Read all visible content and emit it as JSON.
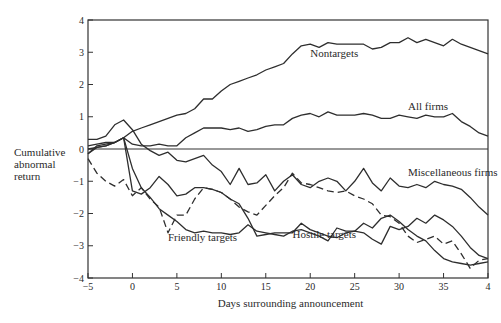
{
  "chart_data": {
    "type": "line",
    "title": "",
    "xlabel": "Days surrounding announcement",
    "ylabel": "Cumulative abnormal return",
    "ylabel_lines": [
      "Cumulative",
      "abnormal",
      "return"
    ],
    "xlim": [
      -5,
      40
    ],
    "ylim": [
      -4,
      4
    ],
    "x_ticks": [
      -5,
      0,
      5,
      10,
      15,
      20,
      25,
      30,
      35,
      40
    ],
    "x_tick_labels": [
      "−5",
      "0",
      "5",
      "10",
      "15",
      "20",
      "25",
      "30",
      "35",
      "4"
    ],
    "y_ticks": [
      -4,
      -3,
      -2,
      -1,
      0,
      1,
      2,
      3,
      4
    ],
    "y_tick_labels": [
      "−4",
      "−3",
      "−2",
      "−1",
      "0",
      "1",
      "2",
      "3",
      "4"
    ],
    "grid": false,
    "zero_line": true,
    "legend": "inline annotations",
    "x": [
      -5,
      -4,
      -3,
      -2,
      -1,
      0,
      1,
      2,
      3,
      4,
      5,
      6,
      7,
      8,
      9,
      10,
      11,
      12,
      13,
      14,
      15,
      16,
      17,
      18,
      19,
      20,
      21,
      22,
      23,
      24,
      25,
      26,
      27,
      28,
      29,
      30,
      31,
      32,
      33,
      34,
      35,
      36,
      37,
      38,
      39,
      40
    ],
    "series": [
      {
        "name": "Nontargets",
        "style": "solid",
        "values": [
          0.0,
          0.05,
          0.1,
          0.2,
          0.35,
          0.55,
          0.65,
          0.75,
          0.85,
          0.95,
          1.05,
          1.1,
          1.25,
          1.55,
          1.55,
          1.8,
          2.0,
          2.1,
          2.2,
          2.3,
          2.45,
          2.55,
          2.65,
          2.95,
          3.2,
          3.25,
          3.15,
          3.3,
          3.25,
          3.25,
          3.25,
          3.25,
          3.1,
          3.15,
          3.3,
          3.3,
          3.45,
          3.3,
          3.4,
          3.3,
          3.2,
          3.4,
          3.25,
          3.15,
          3.05,
          2.95
        ]
      },
      {
        "name": "All firms",
        "style": "solid",
        "values": [
          0.1,
          0.15,
          0.2,
          0.2,
          0.35,
          0.15,
          0.1,
          0.1,
          0.15,
          0.1,
          0.1,
          0.35,
          0.5,
          0.65,
          0.65,
          0.65,
          0.6,
          0.65,
          0.55,
          0.6,
          0.7,
          0.75,
          0.75,
          0.95,
          1.05,
          1.1,
          1.0,
          1.15,
          1.05,
          1.05,
          1.05,
          1.1,
          1.05,
          0.95,
          0.95,
          1.05,
          1.0,
          0.95,
          1.05,
          1.0,
          1.0,
          1.1,
          0.85,
          0.7,
          0.5,
          0.4
        ]
      },
      {
        "name": "Cumulative (upper hump)",
        "style": "solid",
        "values": [
          0.3,
          0.3,
          0.4,
          0.75,
          0.9,
          0.6,
          0.15,
          -0.05,
          -0.2,
          -0.1,
          -0.35,
          -0.4,
          -0.3,
          -0.2,
          -0.5,
          -0.7,
          -1.1,
          -0.6,
          -1.1,
          -1.05,
          -0.8,
          -1.3,
          -1.0,
          -0.8,
          -1.1,
          -1.2,
          -1.0,
          -0.9,
          -1.0,
          -1.3,
          -1.0,
          -0.6,
          -1.05,
          -1.3,
          -0.9,
          -1.15,
          -1.2,
          -1.1,
          -1.2,
          -1.0,
          -1.1,
          -1.15,
          -1.25,
          -1.5,
          -1.8,
          -2.05
        ]
      },
      {
        "name": "Miscellaneous firms",
        "style": "solid",
        "values": [
          -0.15,
          0.1,
          0.15,
          0.2,
          0.35,
          -1.3,
          -1.4,
          -1.2,
          -0.85,
          -1.1,
          -1.45,
          -1.4,
          -1.2,
          -1.2,
          -1.25,
          -1.35,
          -1.55,
          -1.7,
          -2.15,
          -2.7,
          -2.65,
          -2.6,
          -2.6,
          -2.6,
          -2.3,
          -2.5,
          -2.6,
          -2.7,
          -2.75,
          -2.6,
          -2.55,
          -2.6,
          -2.8,
          -2.95,
          -2.4,
          -2.5,
          -2.4,
          -2.15,
          -2.3,
          -2.05,
          -2.2,
          -2.4,
          -2.7,
          -3.05,
          -3.3,
          -3.4
        ]
      },
      {
        "name": "Friendly targets",
        "style": "dashed",
        "values": [
          -0.3,
          -0.75,
          -1.0,
          -1.15,
          -0.95,
          -1.45,
          -1.2,
          -1.55,
          -1.8,
          -2.6,
          -2.05,
          -2.05,
          -1.55,
          -1.2,
          -1.25,
          -1.35,
          -1.55,
          -1.8,
          -1.95,
          -2.05,
          -1.75,
          -1.45,
          -1.2,
          -0.75,
          -1.05,
          -1.1,
          -1.2,
          -1.3,
          -1.35,
          -1.3,
          -1.45,
          -1.55,
          -1.7,
          -2.05,
          -2.1,
          -2.3,
          -2.7,
          -2.9,
          -2.8,
          -2.7,
          -2.95,
          -2.85,
          -3.25,
          -3.7,
          -3.45,
          -3.4
        ]
      },
      {
        "name": "Hostile targets",
        "style": "solid",
        "values": [
          -0.15,
          0.05,
          0.1,
          0.2,
          0.35,
          -0.6,
          -1.2,
          -1.5,
          -1.85,
          -2.05,
          -2.25,
          -2.5,
          -2.6,
          -2.55,
          -2.6,
          -2.6,
          -2.65,
          -2.6,
          -2.35,
          -2.55,
          -2.6,
          -2.65,
          -2.7,
          -2.55,
          -2.5,
          -2.6,
          -2.7,
          -2.85,
          -2.45,
          -2.55,
          -2.55,
          -2.3,
          -2.45,
          -2.15,
          -2.05,
          -2.25,
          -2.5,
          -2.7,
          -2.85,
          -3.15,
          -3.4,
          -3.5,
          -3.55,
          -3.6,
          -3.55,
          -3.5
        ]
      }
    ],
    "annotations": [
      {
        "text": "Nontargets",
        "x": 20,
        "y": 2.85
      },
      {
        "text": "All firms",
        "x": 31,
        "y": 1.2
      },
      {
        "text": "Miscellaneous firms",
        "x": 31,
        "y": -0.85
      },
      {
        "text": "Friendly targets",
        "x": 4,
        "y": -2.85
      },
      {
        "text": "Hostile targets",
        "x": 18,
        "y": -2.75
      }
    ]
  }
}
